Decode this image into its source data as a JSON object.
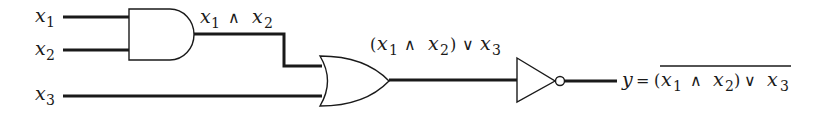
{
  "diagram": {
    "type": "logic-circuit",
    "inputs": [
      {
        "var": "x",
        "sub": "1"
      },
      {
        "var": "x",
        "sub": "2"
      },
      {
        "var": "x",
        "sub": "3"
      }
    ],
    "gates": [
      {
        "id": "and",
        "type": "AND",
        "inputs": [
          "x1",
          "x2"
        ],
        "output_label": "x1 ∧ x2"
      },
      {
        "id": "or",
        "type": "OR",
        "inputs": [
          "x1 ∧ x2",
          "x3"
        ],
        "output_label": "(x1 ∧ x2) ∨ x3"
      },
      {
        "id": "not",
        "type": "NOT",
        "inputs": [
          "(x1 ∧ x2) ∨ x3"
        ],
        "output_label": "y = ¬((x1 ∧ x2) ∨ x3)"
      }
    ],
    "labels": {
      "x": "x",
      "one": "1",
      "two": "2",
      "three": "3",
      "and_sym": "∧",
      "or_sym": "∨",
      "lparen": "(",
      "rparen": ")",
      "y": "y",
      "eq": "="
    },
    "output": "y = (x1 ∧ x2) ∨ x3 (overlined: negation)"
  }
}
